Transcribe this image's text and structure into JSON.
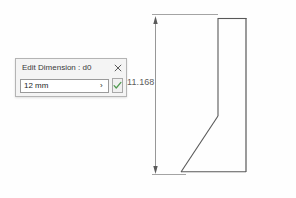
{
  "dimension": {
    "value_label": "11.168"
  },
  "dialog": {
    "title": "Edit Dimension : d0",
    "close_label": "close-icon",
    "input_value": "12 mm",
    "input_placeholder": "",
    "expand_arrow": "›",
    "accept_label": "accept-checkmark-icon",
    "accent_color": "#4f9a4f",
    "border_color": "#b4b4b4",
    "background_color": "#f4f4f4"
  },
  "drawing": {
    "line_color": "#585858",
    "dimension_line_color": "#6a6a6a",
    "profile_name": "sketch-profile",
    "shape_points": "218,18 246,18 246,172 181,172 218,116",
    "dimension_top_y": 18,
    "dimension_bottom_y": 172,
    "dimension_x": 155
  }
}
